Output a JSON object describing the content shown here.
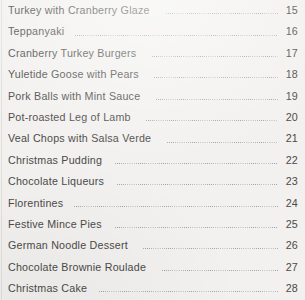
{
  "document": {
    "type": "table-of-contents",
    "text_color": "#4b4a48",
    "background_color": "#f2f1ef",
    "leader_color": "#9b9895"
  },
  "toc": {
    "entries": [
      {
        "title": "Turkey with Cranberry Glaze",
        "page": "15"
      },
      {
        "title": "Teppanyaki",
        "page": "16"
      },
      {
        "title": "Cranberry Turkey Burgers",
        "page": "17"
      },
      {
        "title": "Yuletide Goose with Pears",
        "page": "18"
      },
      {
        "title": "Pork Balls with Mint Sauce",
        "page": "19"
      },
      {
        "title": "Pot-roasted Leg of Lamb",
        "page": "20"
      },
      {
        "title": "Veal Chops with Salsa Verde",
        "page": "21"
      },
      {
        "title": "Christmas Pudding",
        "page": "22"
      },
      {
        "title": "Chocolate Liqueurs",
        "page": "23"
      },
      {
        "title": "Florentines",
        "page": "24"
      },
      {
        "title": "Festive Mince Pies",
        "page": "25"
      },
      {
        "title": "German Noodle Dessert",
        "page": "26"
      },
      {
        "title": "Chocolate Brownie Roulade",
        "page": "27"
      },
      {
        "title": "Christmas Cake",
        "page": "28"
      }
    ]
  }
}
